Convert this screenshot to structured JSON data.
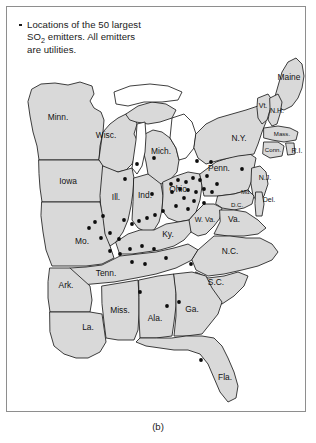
{
  "figure": {
    "caption": "(b)",
    "legend": {
      "bullet_symbol": "•",
      "line1_before_sub": "Locations of the 50 largest",
      "sub": "2",
      "line1_after_sub_prefix": "SO",
      "line2_rest": " emitters. All emitters",
      "line3": "are utilities."
    },
    "colors": {
      "state_fill": "#d9d9d9",
      "state_border": "#1d1d1d",
      "lake_fill": "#ffffff",
      "dot_color": "#0d0d0d",
      "frame_border": "#8e8e8e",
      "background": "#ffffff"
    }
  },
  "map": {
    "title": "Eastern United States SO2 emitter locations",
    "state_labels": [
      {
        "name": "Minn.",
        "x": 52,
        "y": 112,
        "size": "normal"
      },
      {
        "name": "Wisc.",
        "x": 100,
        "y": 130,
        "size": "normal"
      },
      {
        "name": "Mich.",
        "x": 155,
        "y": 146,
        "size": "normal"
      },
      {
        "name": "Iowa",
        "x": 62,
        "y": 176,
        "size": "normal"
      },
      {
        "name": "Ill.",
        "x": 110,
        "y": 192,
        "size": "normal"
      },
      {
        "name": "Ind.",
        "x": 139,
        "y": 190,
        "size": "normal"
      },
      {
        "name": "Ohio",
        "x": 172,
        "y": 184,
        "size": "normal"
      },
      {
        "name": "Penn.",
        "x": 213,
        "y": 163,
        "size": "normal"
      },
      {
        "name": "N.Y.",
        "x": 233,
        "y": 133,
        "size": "normal"
      },
      {
        "name": "Maine",
        "x": 283,
        "y": 72,
        "size": "normal"
      },
      {
        "name": "Vt.",
        "x": 257,
        "y": 100,
        "size": "sm"
      },
      {
        "name": "N.H.",
        "x": 271,
        "y": 105,
        "size": "sm"
      },
      {
        "name": "Mass.",
        "x": 276,
        "y": 128,
        "size": "xs"
      },
      {
        "name": "Conn.",
        "x": 267,
        "y": 144,
        "size": "xs"
      },
      {
        "name": "R.I.",
        "x": 291,
        "y": 145,
        "size": "sm"
      },
      {
        "name": "N.J.",
        "x": 259,
        "y": 172,
        "size": "sm"
      },
      {
        "name": "Md.",
        "x": 240,
        "y": 186,
        "size": "xs"
      },
      {
        "name": "Del.",
        "x": 263,
        "y": 194,
        "size": "sm"
      },
      {
        "name": "D.C.",
        "x": 231,
        "y": 199,
        "size": "xs"
      },
      {
        "name": "W. Va.",
        "x": 199,
        "y": 214,
        "size": "sm"
      },
      {
        "name": "Va.",
        "x": 228,
        "y": 214,
        "size": "normal"
      },
      {
        "name": "Mo.",
        "x": 76,
        "y": 236,
        "size": "normal"
      },
      {
        "name": "Ky.",
        "x": 162,
        "y": 229,
        "size": "normal"
      },
      {
        "name": "N.C.",
        "x": 224,
        "y": 246,
        "size": "normal"
      },
      {
        "name": "Tenn.",
        "x": 100,
        "y": 268,
        "size": "normal"
      },
      {
        "name": "Ark.",
        "x": 60,
        "y": 280,
        "size": "normal"
      },
      {
        "name": "S.C.",
        "x": 210,
        "y": 277,
        "size": "normal"
      },
      {
        "name": "Miss.",
        "x": 114,
        "y": 305,
        "size": "normal"
      },
      {
        "name": "Ala.",
        "x": 149,
        "y": 313,
        "size": "normal"
      },
      {
        "name": "Ga.",
        "x": 186,
        "y": 304,
        "size": "normal"
      },
      {
        "name": "La.",
        "x": 82,
        "y": 322,
        "size": "normal"
      },
      {
        "name": "Fla.",
        "x": 219,
        "y": 372,
        "size": "normal"
      }
    ],
    "emitter_count": 50,
    "emitters": [
      {
        "x": 148,
        "y": 152
      },
      {
        "x": 131,
        "y": 158
      },
      {
        "x": 119,
        "y": 173
      },
      {
        "x": 146,
        "y": 188
      },
      {
        "x": 191,
        "y": 155
      },
      {
        "x": 205,
        "y": 156
      },
      {
        "x": 236,
        "y": 163
      },
      {
        "x": 211,
        "y": 178
      },
      {
        "x": 165,
        "y": 178
      },
      {
        "x": 172,
        "y": 174
      },
      {
        "x": 180,
        "y": 176
      },
      {
        "x": 187,
        "y": 172
      },
      {
        "x": 194,
        "y": 174
      },
      {
        "x": 201,
        "y": 170
      },
      {
        "x": 166,
        "y": 186
      },
      {
        "x": 174,
        "y": 183
      },
      {
        "x": 182,
        "y": 184
      },
      {
        "x": 190,
        "y": 186
      },
      {
        "x": 198,
        "y": 183
      },
      {
        "x": 206,
        "y": 186
      },
      {
        "x": 178,
        "y": 192
      },
      {
        "x": 188,
        "y": 195
      },
      {
        "x": 198,
        "y": 197
      },
      {
        "x": 170,
        "y": 200
      },
      {
        "x": 182,
        "y": 203
      },
      {
        "x": 157,
        "y": 205
      },
      {
        "x": 149,
        "y": 209
      },
      {
        "x": 141,
        "y": 212
      },
      {
        "x": 133,
        "y": 215
      },
      {
        "x": 126,
        "y": 218
      },
      {
        "x": 118,
        "y": 214
      },
      {
        "x": 97,
        "y": 210
      },
      {
        "x": 89,
        "y": 216
      },
      {
        "x": 83,
        "y": 222
      },
      {
        "x": 95,
        "y": 232
      },
      {
        "x": 104,
        "y": 227
      },
      {
        "x": 113,
        "y": 233
      },
      {
        "x": 104,
        "y": 245
      },
      {
        "x": 114,
        "y": 248
      },
      {
        "x": 124,
        "y": 243
      },
      {
        "x": 136,
        "y": 240
      },
      {
        "x": 148,
        "y": 243
      },
      {
        "x": 126,
        "y": 256
      },
      {
        "x": 139,
        "y": 258
      },
      {
        "x": 160,
        "y": 252
      },
      {
        "x": 185,
        "y": 258
      },
      {
        "x": 134,
        "y": 286
      },
      {
        "x": 161,
        "y": 300
      },
      {
        "x": 173,
        "y": 296
      },
      {
        "x": 195,
        "y": 354
      }
    ]
  }
}
